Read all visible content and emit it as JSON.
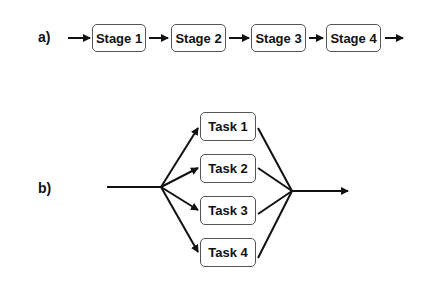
{
  "panel_a": {
    "label": "a)",
    "title": "Sequential pipeline",
    "stages": [
      {
        "label": "Stage 1"
      },
      {
        "label": "Stage 2"
      },
      {
        "label": "Stage 3"
      },
      {
        "label": "Stage 4"
      }
    ]
  },
  "panel_b": {
    "label": "b)",
    "title": "Parallel fork-join",
    "tasks": [
      {
        "label": "Task 1"
      },
      {
        "label": "Task 2"
      },
      {
        "label": "Task 3"
      },
      {
        "label": "Task 4"
      }
    ]
  },
  "colors": {
    "stroke": "#111111",
    "box_border": "#555555",
    "background": "#ffffff"
  }
}
